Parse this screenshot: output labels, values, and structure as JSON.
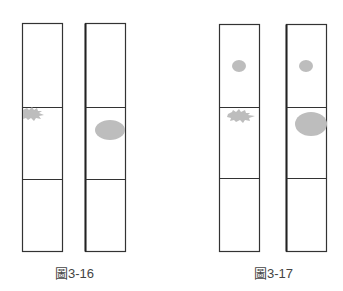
{
  "figures": [
    {
      "id": "fig-3-16",
      "caption": "圖3-16",
      "caption_prefix": "圖",
      "caption_number": "3-16",
      "tubes": [
        {
          "x": 22,
          "spots": [
            {
              "shape": "starburst",
              "cx": 33,
              "cy": 114,
              "rx": 11,
              "ry": 6
            }
          ]
        },
        {
          "x": 85,
          "spots": [
            {
              "shape": "ellipse",
              "cx": 110,
              "cy": 130,
              "rx": 15,
              "ry": 10
            }
          ]
        }
      ]
    },
    {
      "id": "fig-3-17",
      "caption": "圖3-17",
      "caption_prefix": "圖",
      "caption_number": "3-17",
      "tubes": [
        {
          "x": 219,
          "spots": [
            {
              "shape": "circle",
              "cx": 239,
              "cy": 66,
              "rx": 7,
              "ry": 6
            },
            {
              "shape": "starburst",
              "cx": 241,
              "cy": 117,
              "rx": 14,
              "ry": 6
            }
          ]
        },
        {
          "x": 286,
          "spots": [
            {
              "shape": "circle",
              "cx": 306,
              "cy": 66,
              "rx": 7,
              "ry": 6
            },
            {
              "shape": "ellipse",
              "cx": 311,
              "cy": 124,
              "rx": 16,
              "ry": 12
            }
          ]
        }
      ]
    }
  ],
  "colors": {
    "line": "#333333",
    "spot": "#bdbdbd",
    "caption": "#444444"
  }
}
